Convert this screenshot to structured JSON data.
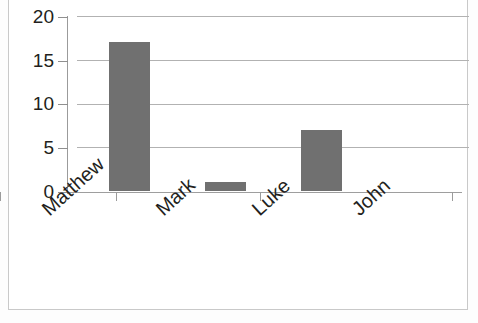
{
  "chart_data": {
    "type": "bar",
    "title": "",
    "subtitle": "",
    "xlabel": "",
    "ylabel": "",
    "categories": [
      "Matthew",
      "Mark",
      "Luke",
      "John"
    ],
    "values": [
      17,
      1,
      7,
      5
    ],
    "ylim": [
      0,
      20
    ],
    "yticks": [
      0,
      5,
      10,
      15,
      20
    ],
    "ytick_labels": [
      "0",
      "5",
      "10",
      "15",
      "20"
    ],
    "grid": true,
    "grid_axis": "y",
    "legend": false,
    "legend_position": "none",
    "series": [
      {
        "name": "",
        "values": [
          17,
          1,
          7,
          5
        ]
      }
    ],
    "bar_color": "#707070",
    "gridline_color": "#b2b2b2",
    "axis_color": "#9b9b9b",
    "text_color": "#231f20",
    "background_color": "#ffffff",
    "xtick_label_rotation": -42
  },
  "axis": {
    "y_labels": [
      {
        "text": "20",
        "value": 20
      },
      {
        "text": "15",
        "value": 15
      },
      {
        "text": "10",
        "value": 10
      },
      {
        "text": "5",
        "value": 5
      },
      {
        "text": "0",
        "value": 0
      }
    ],
    "x_labels": [
      {
        "text": "Matthew"
      },
      {
        "text": "Mark"
      },
      {
        "text": "Luke"
      },
      {
        "text": "John"
      }
    ]
  }
}
